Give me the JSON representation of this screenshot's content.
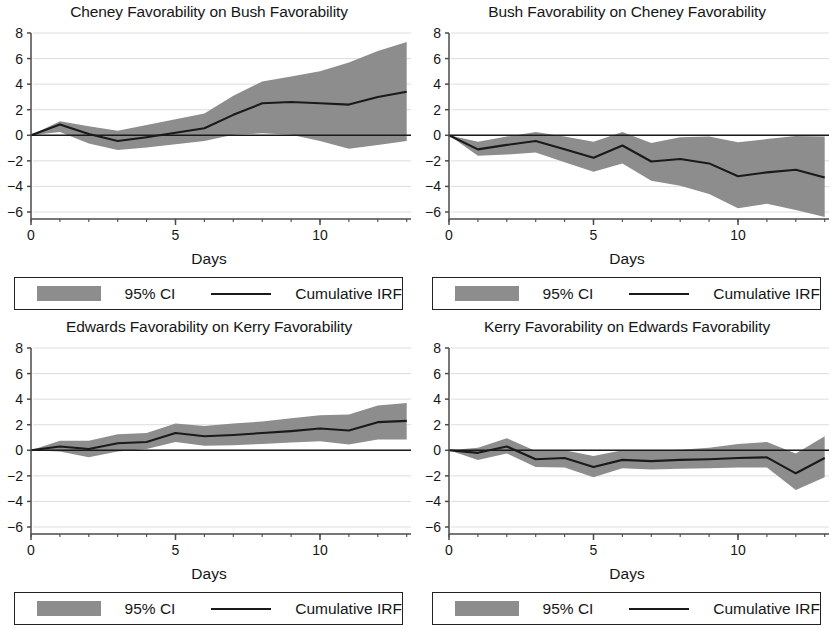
{
  "figure": {
    "panel_width": 418,
    "panel_height": 315,
    "background": "#ffffff",
    "ci_color": "#8d8d8d",
    "line_color": "#1a1a1a",
    "grid_color": "#d9d9d9",
    "axis_color": "#4a4a4a"
  },
  "legend": {
    "ci_label": "95% CI",
    "irf_label": "Cumulative IRF"
  },
  "axis": {
    "xlabel": "Days",
    "x_ticks": [
      {
        "value": 0,
        "label": "0"
      },
      {
        "value": 5,
        "label": "5"
      },
      {
        "value": 10,
        "label": "10"
      }
    ],
    "y_ticks": [
      {
        "value": 8,
        "label": "8"
      },
      {
        "value": 6,
        "label": "6"
      },
      {
        "value": 4,
        "label": "4"
      },
      {
        "value": 2,
        "label": "2"
      },
      {
        "value": 0,
        "label": "0"
      },
      {
        "value": -2,
        "label": "−2"
      },
      {
        "value": -4,
        "label": "−4"
      },
      {
        "value": -6,
        "label": "−6"
      }
    ],
    "xlim": [
      0,
      13
    ],
    "ylim": [
      -7,
      9
    ]
  },
  "chart_data": [
    {
      "id": "cheney-on-bush",
      "type": "area",
      "title": "Cheney Favorability on Bush Favorability",
      "xlabel": "Days",
      "ylabel": "",
      "xlim": [
        0,
        13
      ],
      "ylim": [
        -7,
        9
      ],
      "grid": true,
      "legend": [
        "95% CI",
        "Cumulative IRF"
      ],
      "x": [
        0,
        1,
        2,
        3,
        4,
        5,
        6,
        7,
        8,
        9,
        10,
        11,
        12,
        13
      ],
      "series": [
        {
          "name": "Cumulative IRF",
          "values": [
            0.0,
            0.85,
            0.1,
            -0.45,
            -0.15,
            0.2,
            0.55,
            1.6,
            2.5,
            2.6,
            2.5,
            2.4,
            3.0,
            3.4
          ]
        },
        {
          "name": "CI lower",
          "values": [
            0.0,
            0.25,
            -0.65,
            -1.15,
            -0.95,
            -0.7,
            -0.45,
            0.05,
            0.15,
            0.05,
            -0.45,
            -1.05,
            -0.75,
            -0.45
          ]
        },
        {
          "name": "CI upper",
          "values": [
            0.0,
            1.1,
            0.7,
            0.35,
            0.8,
            1.25,
            1.7,
            3.1,
            4.2,
            4.6,
            5.0,
            5.7,
            6.6,
            7.3
          ]
        }
      ]
    },
    {
      "id": "bush-on-cheney",
      "type": "area",
      "title": "Bush Favorability on Cheney Favorability",
      "xlabel": "Days",
      "ylabel": "",
      "xlim": [
        0,
        13
      ],
      "ylim": [
        -7,
        9
      ],
      "grid": true,
      "legend": [
        "95% CI",
        "Cumulative IRF"
      ],
      "x": [
        0,
        1,
        2,
        3,
        4,
        5,
        6,
        7,
        8,
        9,
        10,
        11,
        12,
        13
      ],
      "series": [
        {
          "name": "Cumulative IRF",
          "values": [
            0.0,
            -1.1,
            -0.75,
            -0.45,
            -1.1,
            -1.75,
            -0.8,
            -2.05,
            -1.85,
            -2.2,
            -3.2,
            -2.9,
            -2.7,
            -3.3
          ]
        },
        {
          "name": "CI lower",
          "values": [
            0.0,
            -1.6,
            -1.5,
            -1.35,
            -2.1,
            -2.85,
            -2.2,
            -3.55,
            -3.95,
            -4.6,
            -5.7,
            -5.35,
            -5.85,
            -6.4
          ]
        },
        {
          "name": "CI upper",
          "values": [
            0.0,
            -0.5,
            -0.1,
            0.25,
            -0.1,
            -0.5,
            0.25,
            -0.6,
            -0.15,
            -0.1,
            -0.55,
            -0.3,
            -0.05,
            -0.1
          ]
        }
      ]
    },
    {
      "id": "edwards-on-kerry",
      "type": "area",
      "title": "Edwards Favorability on Kerry Favorability",
      "xlabel": "Days",
      "ylabel": "",
      "xlim": [
        0,
        13
      ],
      "ylim": [
        -7,
        9
      ],
      "grid": true,
      "legend": [
        "95% CI",
        "Cumulative IRF"
      ],
      "x": [
        0,
        1,
        2,
        3,
        4,
        5,
        6,
        7,
        8,
        9,
        10,
        11,
        12,
        13
      ],
      "series": [
        {
          "name": "Cumulative IRF",
          "values": [
            0.0,
            0.3,
            0.1,
            0.55,
            0.65,
            1.35,
            1.1,
            1.2,
            1.35,
            1.5,
            1.7,
            1.55,
            2.2,
            2.3
          ]
        },
        {
          "name": "CI lower",
          "values": [
            0.0,
            -0.1,
            -0.55,
            -0.1,
            0.1,
            0.65,
            0.35,
            0.4,
            0.5,
            0.6,
            0.7,
            0.45,
            0.85,
            0.85
          ]
        },
        {
          "name": "CI upper",
          "values": [
            0.0,
            0.75,
            0.75,
            1.25,
            1.35,
            2.1,
            1.9,
            2.1,
            2.25,
            2.5,
            2.75,
            2.8,
            3.5,
            3.7
          ]
        }
      ]
    },
    {
      "id": "kerry-on-edwards",
      "type": "area",
      "title": "Kerry Favorability on Edwards Favorability",
      "xlabel": "Days",
      "ylabel": "",
      "xlim": [
        0,
        13
      ],
      "ylim": [
        -7,
        9
      ],
      "grid": true,
      "legend": [
        "95% CI",
        "Cumulative IRF"
      ],
      "x": [
        0,
        1,
        2,
        3,
        4,
        5,
        6,
        7,
        8,
        9,
        10,
        11,
        12,
        13
      ],
      "series": [
        {
          "name": "Cumulative IRF",
          "values": [
            0.0,
            -0.2,
            0.3,
            -0.7,
            -0.6,
            -1.3,
            -0.75,
            -0.85,
            -0.75,
            -0.7,
            -0.6,
            -0.55,
            -1.8,
            -0.6
          ]
        },
        {
          "name": "CI lower",
          "values": [
            0.0,
            -0.75,
            -0.25,
            -1.3,
            -1.35,
            -2.1,
            -1.4,
            -1.5,
            -1.45,
            -1.4,
            -1.35,
            -1.35,
            -3.1,
            -2.1
          ]
        },
        {
          "name": "CI upper",
          "values": [
            0.0,
            0.2,
            0.95,
            -0.05,
            0.0,
            -0.45,
            0.0,
            -0.05,
            0.05,
            0.2,
            0.5,
            0.65,
            -0.25,
            1.1
          ]
        }
      ]
    }
  ],
  "panels": [
    {
      "left": 0,
      "top": 0
    },
    {
      "left": 418,
      "top": 0
    },
    {
      "left": 0,
      "top": 315
    },
    {
      "left": 418,
      "top": 315
    }
  ]
}
